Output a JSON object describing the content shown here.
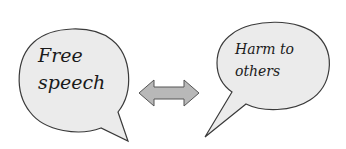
{
  "diagram": {
    "left_bubble": {
      "lines": [
        "Free",
        "speech"
      ]
    },
    "right_bubble": {
      "lines": [
        "Harm to",
        "others"
      ]
    },
    "connector": "double-headed-arrow",
    "colors": {
      "bubble_fill": "#ebebeb",
      "bubble_stroke": "#3a3a3a",
      "arrow_fill": "#b8b8b8",
      "arrow_stroke": "#555555",
      "background": "#ffffff"
    }
  }
}
